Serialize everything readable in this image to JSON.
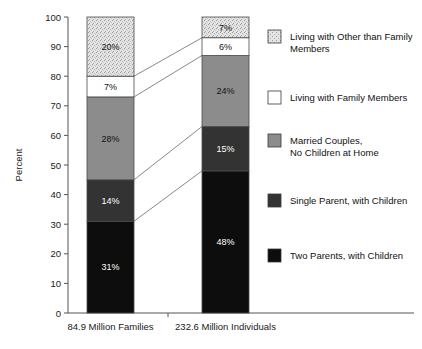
{
  "chart_data": {
    "type": "bar",
    "subtype": "100% stacked bar with category linking lines",
    "title": "",
    "xlabel": "",
    "ylabel": "Percent",
    "ylim": [
      0,
      100
    ],
    "ytick_labels": [
      "0",
      "10",
      "20",
      "30",
      "40",
      "50",
      "60",
      "70",
      "80",
      "90",
      "100"
    ],
    "ytick_values": [
      0,
      10,
      20,
      30,
      40,
      50,
      60,
      70,
      80,
      90,
      100
    ],
    "grid": false,
    "legend_position": "right",
    "categories": [
      "84.9 Million Families",
      "232.6 Million Individuals"
    ],
    "series": [
      {
        "name": "Two Parents, with Children",
        "color": "#0d0d0d",
        "values": [
          31,
          48
        ],
        "labels": [
          "31%",
          "48%"
        ],
        "label_color": "#ffffff"
      },
      {
        "name": "Single Parent, with Children",
        "color": "#333333",
        "values": [
          14,
          15
        ],
        "labels": [
          "14%",
          "15%"
        ],
        "label_color": "#ffffff"
      },
      {
        "name": "Married Couples,\nNo Children at Home",
        "color": "#8c8c8c",
        "values": [
          28,
          24
        ],
        "labels": [
          "28%",
          "24%"
        ],
        "label_color": "#111111"
      },
      {
        "name": "Living with Family Members",
        "color": "#ffffff",
        "values": [
          7,
          6
        ],
        "labels": [
          "7%",
          "6%"
        ],
        "label_color": "#111111"
      },
      {
        "name": "Living with Other than Family\nMembers",
        "color": "#dedede",
        "values": [
          20,
          7
        ],
        "labels": [
          "20%",
          "7%"
        ],
        "label_color": "#111111"
      }
    ],
    "legend_entries": [
      {
        "label_line1": "Living with Other than Family",
        "label_line2": "Members",
        "color": "#dedede",
        "pattern": "speckle"
      },
      {
        "label_line1": "Living with Family Members",
        "label_line2": "",
        "color": "#ffffff",
        "pattern": "solid"
      },
      {
        "label_line1": "Married Couples,",
        "label_line2": "No Children at Home",
        "color": "#8c8c8c",
        "pattern": "solid"
      },
      {
        "label_line1": "Single Parent, with Children",
        "label_line2": "",
        "color": "#333333",
        "pattern": "solid"
      },
      {
        "label_line1": "Two Parents, with Children",
        "label_line2": "",
        "color": "#0d0d0d",
        "pattern": "solid"
      }
    ]
  },
  "axis": {
    "y_title": "Percent"
  }
}
